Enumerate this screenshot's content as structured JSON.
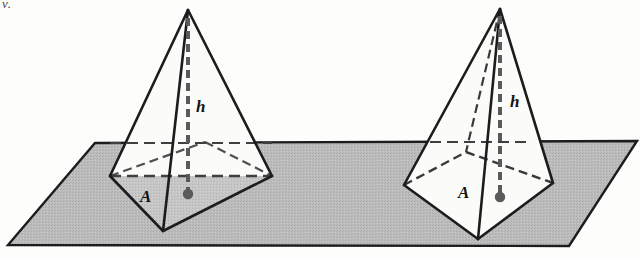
{
  "figure": {
    "corner_mark": "v.",
    "colors": {
      "plane_fill": "#b9b9b9",
      "plane_stroke": "#1c1c1c",
      "pyramid_fill_light": "#fbfbfa",
      "pyramid_fill_shaded": "#c2c2c2",
      "outline": "#1c1c1c",
      "dashed": "#4f4f4f",
      "dot": "#5a5a5a",
      "label": "#141414"
    },
    "labels": {
      "left_area": "A",
      "left_height": "h",
      "right_area": "A",
      "right_height": "h"
    },
    "left_pyramid": {
      "name": "tall-narrow-pyramid",
      "apex": [
        188,
        10
      ],
      "base_left": [
        110,
        176
      ],
      "base_right": [
        272,
        176
      ],
      "base_front": [
        163,
        231
      ],
      "base_back": [
        205,
        142
      ],
      "centroid_dot": [
        188,
        194
      ],
      "height_foot": [
        188,
        194
      ]
    },
    "right_pyramid": {
      "name": "wide-pyramid",
      "apex": [
        500,
        9
      ],
      "base_left": [
        404,
        185
      ],
      "base_right": [
        553,
        183
      ],
      "base_front": [
        478,
        239
      ],
      "base_back": [
        466,
        152
      ],
      "centroid_dot": [
        500,
        197
      ],
      "height_foot": [
        500,
        197
      ]
    },
    "plane": {
      "name": "horizontal-plane",
      "top_left": [
        95,
        143
      ],
      "top_right": [
        637,
        141
      ],
      "bottom_right": [
        569,
        246
      ],
      "bottom_left": [
        8,
        245
      ]
    }
  }
}
